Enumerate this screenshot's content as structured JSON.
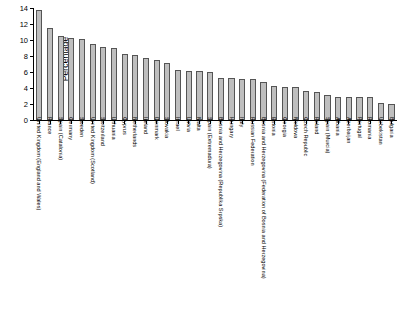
{
  "chart_data": {
    "type": "bar",
    "title": "",
    "subtitle": "",
    "xlabel": "",
    "ylabel": "Percentage",
    "ylim": [
      0,
      14
    ],
    "yticks": [
      0,
      2,
      4,
      6,
      8,
      10,
      12,
      14
    ],
    "grid": false,
    "legend": null,
    "bar_color": "#bfbfbf",
    "bar_edge_color": "#555555",
    "categories": [
      "United Kingdom (England and Wales)",
      "France",
      "Spain (Catalonia)",
      "Germany",
      "Sweden",
      "United Kingdom (Scotland)",
      "Switzerland",
      "Lithuania",
      "Cyprus",
      "Netherlands",
      "Ireland",
      "Denmark",
      "Slovakia",
      "Israel",
      "Latvia",
      "Malta",
      "Spain (Extremadura)",
      "Bosnia and Herzegovina (Republika Srpska)",
      "Hungary",
      "Italy",
      "Russian Federation",
      "Bosnia and Herzegovina (Federation of Bosnia and Herzegovina)",
      "Estonia",
      "Georgia",
      "Moldova",
      "Czech Republic",
      "Poland",
      "Spain (Murcia)",
      "Albania",
      "Azerbaijan",
      "Portugal",
      "Romania",
      "Uzbekistan",
      "Bulgaria"
    ],
    "values": [
      13.8,
      11.5,
      10.5,
      10.3,
      10.1,
      9.5,
      9.1,
      9.0,
      8.2,
      8.1,
      7.8,
      7.5,
      7.1,
      6.2,
      6.1,
      6.1,
      6.0,
      5.2,
      5.2,
      5.1,
      5.1,
      4.8,
      4.3,
      4.1,
      4.1,
      3.6,
      3.5,
      3.1,
      2.9,
      2.9,
      2.9,
      2.9,
      2.1,
      2.0
    ]
  }
}
